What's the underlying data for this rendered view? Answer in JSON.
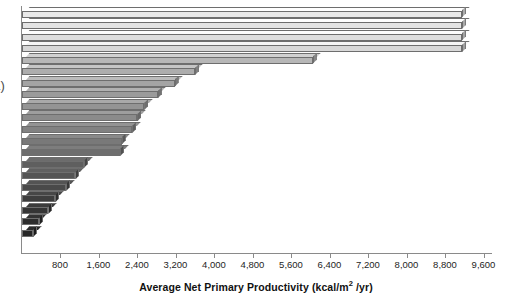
{
  "panel": {
    "label": "a)"
  },
  "chart_data": {
    "type": "bar",
    "orientation": "horizontal",
    "title": "",
    "xlabel": "Average Net Primary Productivity (kcal/m² /yr)",
    "ylabel": "",
    "xlim": [
      0,
      9600
    ],
    "grid": false,
    "legend": false,
    "xticks": [
      800,
      1600,
      2400,
      3200,
      4000,
      4800,
      5600,
      6400,
      7200,
      8000,
      8800,
      9600
    ],
    "xtick_labels": [
      "800",
      "1,600",
      "2,400",
      "3,200",
      "4,000",
      "4,800",
      "5,600",
      "6,400",
      "7,200",
      "8,000",
      "8,800",
      "9,600"
    ],
    "categories": [
      "",
      "",
      "",
      "",
      "",
      "",
      "",
      "",
      "",
      "",
      "",
      "",
      "",
      "",
      "",
      "",
      "",
      "",
      "",
      ""
    ],
    "values": [
      9150,
      9150,
      9150,
      9150,
      6050,
      3600,
      3180,
      2830,
      2550,
      2400,
      2300,
      2080,
      2050,
      1300,
      1120,
      930,
      700,
      560,
      360,
      240
    ],
    "bar_colors": [
      "#e9e9e9",
      "#e4e4e4",
      "#dedede",
      "#d8d8d8",
      "#b7b7b7",
      "#adadad",
      "#a4a4a4",
      "#9b9b9b",
      "#949494",
      "#8b8b8b",
      "#828282",
      "#797979",
      "#6e6e6e",
      "#5f5f5f",
      "#545454",
      "#4a4a4a",
      "#3e3e3e",
      "#353535",
      "#2d2d2d",
      "#262626"
    ],
    "axis_color": "#8a8a8a",
    "bar_edge_color": "#6e6e6e"
  }
}
